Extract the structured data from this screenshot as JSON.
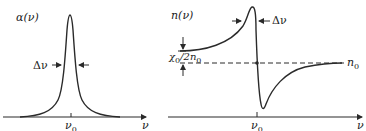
{
  "left_panel": {
    "title": "α(ν)",
    "linewidth_label": "Δν",
    "center_label": "ν",
    "center_subscript": "0",
    "x_axis_label": "ν",
    "curve": "Lorentzian absorption line centered at ν0"
  },
  "right_panel": {
    "title": "n(ν)",
    "linewidth_label": "Δν",
    "offset_label_num": "χ",
    "offset_label_num_sub": "0",
    "offset_label_den": "/2n",
    "offset_label_den_sub": "0",
    "baseline_label": "n",
    "baseline_subscript": "0",
    "center_label": "ν",
    "center_subscript": "0",
    "x_axis_label": "ν",
    "curve": "Dispersive refractive-index profile around n0, max below ν0, min above ν0"
  },
  "colors": {
    "line": "#2a2a2a",
    "background": "#ffffff"
  }
}
